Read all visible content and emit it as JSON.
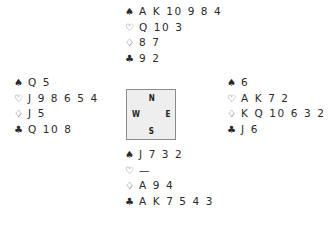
{
  "suits": {
    "spades": "♠",
    "hearts": "♡",
    "diamonds": "♢",
    "clubs": "♣"
  },
  "hands": {
    "north": {
      "spades": "A K 10 9 8 4",
      "hearts": "Q 10 3",
      "diamonds": "8 7",
      "clubs": "9 2"
    },
    "west": {
      "spades": "Q 5",
      "hearts": "J 9 8 6 5 4",
      "diamonds": "J 5",
      "clubs": "Q 10 8"
    },
    "east": {
      "spades": "6",
      "hearts": "A K 7 2",
      "diamonds": "K Q 10 6 3 2",
      "clubs": "J 6"
    },
    "south": {
      "spades": "J 7 3 2",
      "hearts": "—",
      "diamonds": "A 9 4",
      "clubs": "A K 7 5 4 3"
    }
  },
  "compass": {
    "n": "N",
    "s": "S",
    "w": "W",
    "e": "E"
  }
}
